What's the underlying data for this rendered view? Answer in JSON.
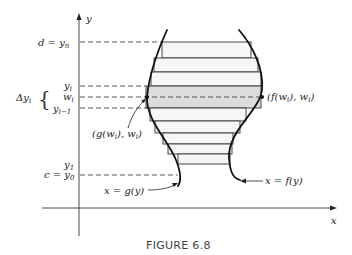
{
  "figure": {
    "caption": "FIGURE 6.8",
    "axes": {
      "x_label": "x",
      "y_label": "y"
    },
    "y_levels": {
      "d_label": "d = y",
      "d_sub": "n",
      "yi_label": "y",
      "yi_sub": "i",
      "wi_label": "w",
      "wi_sub": "i",
      "yi1_label": "y",
      "yi1_sub": "i−1",
      "y1_label": "y",
      "y1_sub": "1",
      "c_label": "c = y",
      "c_sub": "0"
    },
    "delta_label": "Δy",
    "delta_sub": "i",
    "delta_brace": "{",
    "point_left": "(g(w",
    "point_left_sub": "i",
    "point_left_end": "), w",
    "point_left_end_sub": "i",
    "point_left_close": ")",
    "point_right": "(f(w",
    "point_right_sub": "i",
    "point_right_end": "), w",
    "point_right_end_sub": "i",
    "point_right_close": ")",
    "curve_left_label": "x = g(y)",
    "curve_right_label": "x = f(y)",
    "colors": {
      "line": "#222222",
      "rect_fill": "#f4f4f4",
      "highlight_fill": "#dcdcdc"
    }
  }
}
